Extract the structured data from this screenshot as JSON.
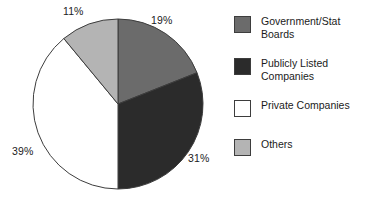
{
  "chart_data": {
    "type": "pie",
    "title": "",
    "subtitle": "",
    "xlabel": "",
    "ylabel": "",
    "grid": false,
    "legend_position": "right",
    "start_angle_deg": 0,
    "direction": "clockwise",
    "categories": [
      "Government/Stat Boards",
      "Publicly Listed Companies",
      "Private Companies",
      "Others"
    ],
    "values": [
      19,
      31,
      39,
      11
    ],
    "value_unit": "%",
    "data_labels": [
      "19%",
      "31%",
      "39%",
      "11%"
    ],
    "colors": [
      "#6b6b6b",
      "#2b2b2b",
      "#ffffff",
      "#b4b4b4"
    ],
    "slices": [
      {
        "label": "Government/Stat Boards",
        "legend_line_1": "Government/Stat",
        "legend_line_2": "Boards",
        "value": 19,
        "data_label": "19%",
        "color": "#6b6b6b",
        "start_deg": 0,
        "end_deg": 68.4
      },
      {
        "label": "Publicly Listed Companies",
        "legend_line_1": "Publicly Listed",
        "legend_line_2": "Companies",
        "value": 31,
        "data_label": "31%",
        "color": "#2b2b2b",
        "start_deg": 68.4,
        "end_deg": 180.0
      },
      {
        "label": "Private Companies",
        "legend_line_1": "Private Companies",
        "legend_line_2": "",
        "value": 39,
        "data_label": "39%",
        "color": "#ffffff",
        "start_deg": 180.0,
        "end_deg": 320.4
      },
      {
        "label": "Others",
        "legend_line_1": "Others",
        "legend_line_2": "",
        "value": 11,
        "data_label": "11%",
        "color": "#b4b4b4",
        "start_deg": 320.4,
        "end_deg": 360.0
      }
    ]
  },
  "legend": {
    "items": [
      {
        "label_line_1": "Government/Stat",
        "label_line_2": "Boards",
        "color": "#6b6b6b"
      },
      {
        "label_line_1": "Publicly Listed",
        "label_line_2": "Companies",
        "color": "#2b2b2b"
      },
      {
        "label_line_1": "Private Companies",
        "label_line_2": "",
        "color": "#ffffff"
      },
      {
        "label_line_1": "Others",
        "label_line_2": "",
        "color": "#b4b4b4"
      }
    ]
  },
  "colors": {
    "outline": "#3d3d3d",
    "text": "#1b1b1b",
    "background": "#ffffff"
  }
}
